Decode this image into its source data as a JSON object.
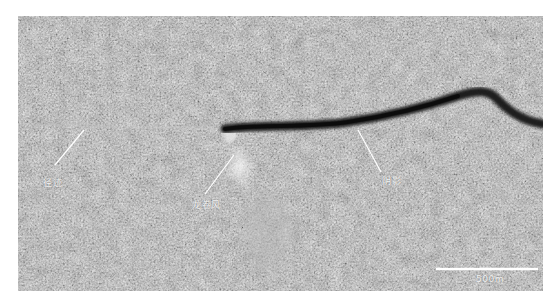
{
  "figure": {
    "labels": {
      "track": "径迹",
      "dust_devil": "龙卷风",
      "shadow": "阴影"
    },
    "scale_bar": {
      "label": "500m"
    }
  }
}
